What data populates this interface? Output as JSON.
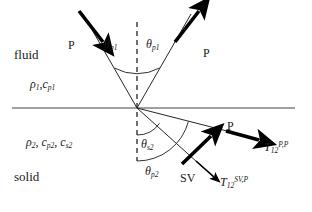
{
  "figure": {
    "colors": {
      "interface_line": "#808080",
      "ray_line": "#262626",
      "arrow_fill": "#000000",
      "arc_line": "#333333",
      "normal_dash": "#333333",
      "text": "#1a1a1a",
      "background": "#ffffff"
    }
  },
  "media": {
    "upper": {
      "name": "fluid",
      "properties_plain": "ρ1, cp1",
      "density_symbol": "ρ",
      "density_sub": "1",
      "speed_symbol": "c",
      "speed_sub": "p1"
    },
    "lower": {
      "name": "solid",
      "properties_plain": "ρ2, cp2, cs2",
      "density_symbol": "ρ",
      "density_sub": "2",
      "speed_p_symbol": "c",
      "speed_p_sub": "p2",
      "speed_s_symbol": "c",
      "speed_s_sub": "s2"
    }
  },
  "waves": {
    "incident": {
      "label": "P",
      "angle_symbol": "θ",
      "angle_sub": "p1",
      "angle_plain": "θp1"
    },
    "reflected": {
      "label": "P",
      "angle_symbol": "θ",
      "angle_sub": "p1",
      "angle_plain": "θp1"
    },
    "transmitted_p": {
      "label": "P",
      "angle_symbol": "θ",
      "angle_sub": "p2",
      "angle_plain": "θp2",
      "coefficient_symbol": "T",
      "coefficient_sub": "12",
      "coefficient_sup": "P,P",
      "coefficient_plain": "T12 P,P"
    },
    "transmitted_sv": {
      "label": "SV",
      "angle_symbol": "θ",
      "angle_sub": "s2",
      "angle_plain": "θs2",
      "coefficient_symbol": "T",
      "coefficient_sub": "12",
      "coefficient_sup": "SV,P",
      "coefficient_plain": "T12 SV,P"
    }
  },
  "geometry": {
    "origin_x": 137,
    "origin_y": 108,
    "interface_x_start": 12,
    "interface_x_end": 295,
    "normal_y_top": 22,
    "normal_y_bottom": 161,
    "theta_p1_deg": 30,
    "theta_p2_deg": 76,
    "theta_s2_deg": 56
  }
}
